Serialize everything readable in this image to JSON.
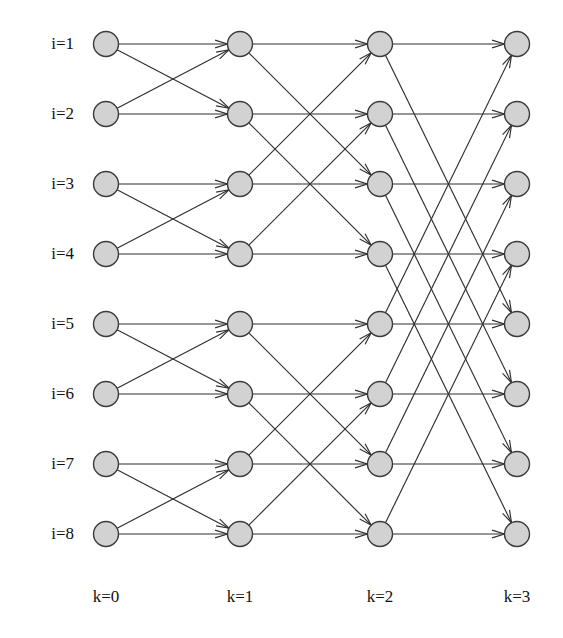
{
  "figure": {
    "title": "",
    "caption_fragment": "",
    "background_color": "#ffffff",
    "node_fill_color": "#d2d2d2",
    "node_stroke_color": "#3a3a3a",
    "edge_color": "#2e2e2e"
  },
  "chart_data": {
    "type": "diagram",
    "diagram_kind": "butterfly-network",
    "title": "",
    "xlabel": "",
    "ylabel": "",
    "columns": 4,
    "rows": 8,
    "column_labels": [
      "k=0",
      "k=1",
      "k=2",
      "k=3"
    ],
    "row_labels": [
      "i=1",
      "i=2",
      "i=3",
      "i=4",
      "i=5",
      "i=6",
      "i=7",
      "i=8"
    ],
    "column_x": [
      106,
      240,
      380,
      517
    ],
    "row_y": [
      44,
      114,
      184,
      254,
      324,
      394,
      464,
      534
    ],
    "node_radius": 12.5,
    "column_label_y": 597,
    "stage_offsets": {
      "stride_by_stage": [
        1,
        2,
        4
      ]
    },
    "edges": [
      {
        "stage": 0,
        "from_row": 1,
        "to_row": 1
      },
      {
        "stage": 0,
        "from_row": 1,
        "to_row": 2
      },
      {
        "stage": 0,
        "from_row": 2,
        "to_row": 2
      },
      {
        "stage": 0,
        "from_row": 2,
        "to_row": 1
      },
      {
        "stage": 0,
        "from_row": 3,
        "to_row": 3
      },
      {
        "stage": 0,
        "from_row": 3,
        "to_row": 4
      },
      {
        "stage": 0,
        "from_row": 4,
        "to_row": 4
      },
      {
        "stage": 0,
        "from_row": 4,
        "to_row": 3
      },
      {
        "stage": 0,
        "from_row": 5,
        "to_row": 5
      },
      {
        "stage": 0,
        "from_row": 5,
        "to_row": 6
      },
      {
        "stage": 0,
        "from_row": 6,
        "to_row": 6
      },
      {
        "stage": 0,
        "from_row": 6,
        "to_row": 5
      },
      {
        "stage": 0,
        "from_row": 7,
        "to_row": 7
      },
      {
        "stage": 0,
        "from_row": 7,
        "to_row": 8
      },
      {
        "stage": 0,
        "from_row": 8,
        "to_row": 8
      },
      {
        "stage": 0,
        "from_row": 8,
        "to_row": 7
      },
      {
        "stage": 1,
        "from_row": 1,
        "to_row": 1
      },
      {
        "stage": 1,
        "from_row": 1,
        "to_row": 3
      },
      {
        "stage": 1,
        "from_row": 2,
        "to_row": 2
      },
      {
        "stage": 1,
        "from_row": 2,
        "to_row": 4
      },
      {
        "stage": 1,
        "from_row": 3,
        "to_row": 3
      },
      {
        "stage": 1,
        "from_row": 3,
        "to_row": 1
      },
      {
        "stage": 1,
        "from_row": 4,
        "to_row": 4
      },
      {
        "stage": 1,
        "from_row": 4,
        "to_row": 2
      },
      {
        "stage": 1,
        "from_row": 5,
        "to_row": 5
      },
      {
        "stage": 1,
        "from_row": 5,
        "to_row": 7
      },
      {
        "stage": 1,
        "from_row": 6,
        "to_row": 6
      },
      {
        "stage": 1,
        "from_row": 6,
        "to_row": 8
      },
      {
        "stage": 1,
        "from_row": 7,
        "to_row": 7
      },
      {
        "stage": 1,
        "from_row": 7,
        "to_row": 5
      },
      {
        "stage": 1,
        "from_row": 8,
        "to_row": 8
      },
      {
        "stage": 1,
        "from_row": 8,
        "to_row": 6
      },
      {
        "stage": 2,
        "from_row": 1,
        "to_row": 1
      },
      {
        "stage": 2,
        "from_row": 1,
        "to_row": 5
      },
      {
        "stage": 2,
        "from_row": 2,
        "to_row": 2
      },
      {
        "stage": 2,
        "from_row": 2,
        "to_row": 6
      },
      {
        "stage": 2,
        "from_row": 3,
        "to_row": 3
      },
      {
        "stage": 2,
        "from_row": 3,
        "to_row": 7
      },
      {
        "stage": 2,
        "from_row": 4,
        "to_row": 4
      },
      {
        "stage": 2,
        "from_row": 4,
        "to_row": 8
      },
      {
        "stage": 2,
        "from_row": 5,
        "to_row": 5
      },
      {
        "stage": 2,
        "from_row": 5,
        "to_row": 1
      },
      {
        "stage": 2,
        "from_row": 6,
        "to_row": 6
      },
      {
        "stage": 2,
        "from_row": 6,
        "to_row": 2
      },
      {
        "stage": 2,
        "from_row": 7,
        "to_row": 7
      },
      {
        "stage": 2,
        "from_row": 7,
        "to_row": 3
      },
      {
        "stage": 2,
        "from_row": 8,
        "to_row": 8
      },
      {
        "stage": 2,
        "from_row": 8,
        "to_row": 4
      }
    ]
  }
}
